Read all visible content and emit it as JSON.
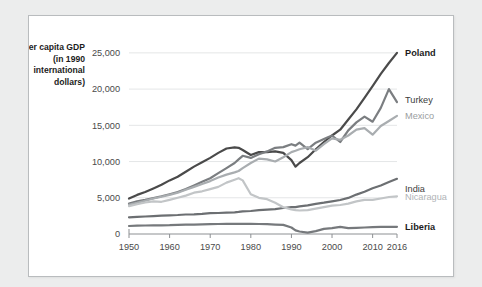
{
  "chart_data": {
    "type": "line",
    "title": "",
    "xlabel": "",
    "ylabel": "Per capita GDP (in 1990 international dollars)",
    "xlim": [
      1950,
      2016
    ],
    "ylim": [
      0,
      26500
    ],
    "grid": true,
    "legend_position": "right-inline",
    "x_ticks": [
      "1950",
      "1960",
      "1970",
      "1980",
      "1990",
      "2000",
      "2010",
      "2016"
    ],
    "x_tick_values": [
      1950,
      1960,
      1970,
      1980,
      1990,
      2000,
      2010,
      2016
    ],
    "y_ticks": [
      "0",
      "5,000",
      "10,000",
      "15,000",
      "20,000",
      "25,000"
    ],
    "y_tick_values": [
      0,
      5000,
      10000,
      15000,
      20000,
      25000
    ],
    "x": [
      1950,
      1952,
      1954,
      1956,
      1958,
      1960,
      1962,
      1964,
      1966,
      1968,
      1970,
      1972,
      1974,
      1976,
      1977,
      1978,
      1980,
      1982,
      1984,
      1986,
      1988,
      1990,
      1991,
      1992,
      1994,
      1996,
      1998,
      2000,
      2002,
      2004,
      2006,
      2008,
      2010,
      2012,
      2014,
      2016
    ],
    "series": [
      {
        "name": "Poland",
        "color": "#4a4a4a",
        "label_color": "#1c1c1c",
        "label_y_value": 25000,
        "values": [
          4900,
          5400,
          5800,
          6300,
          6800,
          7400,
          7900,
          8600,
          9300,
          9900,
          10500,
          11200,
          11800,
          11950,
          11900,
          11600,
          10900,
          11300,
          11300,
          11400,
          11200,
          10200,
          9300,
          9800,
          10600,
          11700,
          12700,
          13600,
          14400,
          15800,
          17200,
          18800,
          20400,
          22100,
          23600,
          25000
        ]
      },
      {
        "name": "Turkey",
        "color": "#7b7e81",
        "label_color": "#3c3c3c",
        "label_y_value": 18600,
        "values": [
          4200,
          4500,
          4700,
          4950,
          5200,
          5500,
          5800,
          6200,
          6700,
          7200,
          7700,
          8400,
          9100,
          9800,
          10300,
          10800,
          10500,
          11000,
          11400,
          11900,
          12000,
          12400,
          12200,
          12600,
          11700,
          12600,
          13100,
          13600,
          12700,
          14300,
          15400,
          16200,
          15500,
          17400,
          20000,
          18200
        ]
      },
      {
        "name": "Mexico",
        "color": "#a9adb0",
        "label_color": "#9a9ea1",
        "label_y_value": 16300,
        "values": [
          4050,
          4300,
          4600,
          4900,
          5150,
          5400,
          5700,
          6100,
          6500,
          6900,
          7300,
          7800,
          8200,
          8500,
          8700,
          9100,
          9800,
          10400,
          10300,
          10000,
          10600,
          11300,
          11500,
          11700,
          12000,
          11500,
          12400,
          13200,
          13000,
          13600,
          14400,
          14600,
          13700,
          14900,
          15600,
          16300
        ]
      },
      {
        "name": "India",
        "color": "#6c6f72",
        "label_color": "#3c3c3c",
        "label_y_value": 6200,
        "values": [
          2450,
          2600,
          2750,
          2900,
          3050,
          3200,
          3300,
          3500,
          3550,
          3750,
          4000,
          4050,
          4150,
          4300,
          4450,
          4700,
          4800,
          5100,
          5300,
          5500,
          5900,
          6300,
          6250,
          6500,
          6900,
          7500,
          7900,
          8400,
          8900,
          9700,
          10900,
          12000,
          13300,
          14300,
          15600,
          16800
        ]
      },
      {
        "name": "Nicaragua",
        "color": "#c2c5c7",
        "label_color": "#b0b3b6",
        "label_y_value": 5200,
        "values": [
          3850,
          4100,
          4350,
          4500,
          4450,
          4700,
          5000,
          5300,
          5700,
          5900,
          6200,
          6500,
          7100,
          7500,
          7700,
          7400,
          5500,
          5000,
          4800,
          4300,
          3700,
          3400,
          3300,
          3250,
          3300,
          3500,
          3700,
          3900,
          4000,
          4200,
          4500,
          4700,
          4700,
          4900,
          5100,
          5200
        ]
      },
      {
        "name": "Liberia",
        "color": "#76797c",
        "label_color": "#1c1c1c",
        "label_y_value": 1050,
        "values": [
          1100,
          1150,
          1180,
          1200,
          1200,
          1220,
          1250,
          1280,
          1300,
          1320,
          1350,
          1380,
          1400,
          1400,
          1400,
          1400,
          1400,
          1380,
          1350,
          1300,
          1250,
          900,
          500,
          350,
          200,
          400,
          700,
          820,
          1000,
          800,
          850,
          900,
          950,
          980,
          1000,
          1000
        ]
      }
    ],
    "india_note": "India series uses values scaled to chart; see india_values",
    "india_values": [
      2450,
      2600,
      2750,
      2900,
      3050,
      3200,
      3300,
      3500,
      3550,
      3750,
      4000,
      4050,
      4150,
      4300,
      4450,
      4700,
      4800,
      5100,
      5300,
      5500,
      5900,
      6300,
      6250,
      6500,
      6900,
      7500,
      7900,
      8400,
      8900,
      9700,
      10900,
      12000,
      13300,
      14300,
      15600,
      16800
    ]
  }
}
